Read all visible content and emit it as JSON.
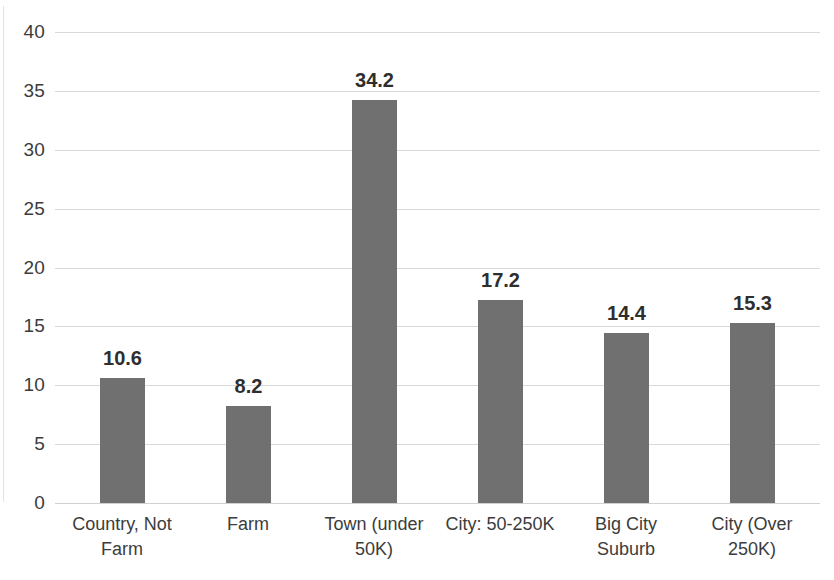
{
  "chart_data": {
    "type": "bar",
    "title": "",
    "subtitle": "",
    "xlabel": "",
    "ylabel": "",
    "categories": [
      "Country, Not Farm",
      "Farm",
      "Town (under 50K)",
      "City: 50-250K",
      "Big City Suburb",
      "City (Over 250K)"
    ],
    "category_lines": [
      [
        "Country, Not",
        "Farm"
      ],
      [
        "Farm"
      ],
      [
        "Town (under",
        "50K)"
      ],
      [
        "City: 50-250K"
      ],
      [
        "Big City",
        "Suburb"
      ],
      [
        "City (Over",
        "250K)"
      ]
    ],
    "values": [
      10.6,
      8.2,
      34.2,
      17.2,
      14.4,
      15.3
    ],
    "data_labels": [
      "10.6",
      "8.2",
      "34.2",
      "17.2",
      "14.4",
      "15.3"
    ],
    "ylim": [
      0,
      40
    ],
    "ytick_step": 5,
    "ytick_labels": [
      "40",
      "35",
      "30",
      "25",
      "20",
      "15",
      "10",
      "5",
      "0"
    ],
    "ytick_values": [
      40,
      35,
      30,
      25,
      20,
      15,
      10,
      5,
      0
    ],
    "grid": "horizontal",
    "legend": "none",
    "series": [
      {
        "name": "",
        "values": [
          10.6,
          8.2,
          34.2,
          17.2,
          14.4,
          15.3
        ]
      }
    ],
    "colors": {
      "bar": "#707070",
      "gridline": "#D9D9D9",
      "text": "#3C3C3C",
      "data_label": "#2E2E2E",
      "background": "#FFFFFF"
    }
  }
}
